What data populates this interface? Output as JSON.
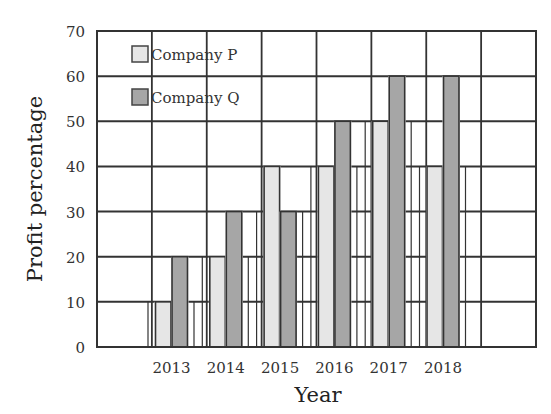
{
  "chart_data": {
    "type": "bar",
    "title": "",
    "xlabel": "Year",
    "ylabel": "Profit percentage",
    "categories": [
      "2013",
      "2014",
      "2015",
      "2016",
      "2017",
      "2018"
    ],
    "series": [
      {
        "name": "Company P",
        "values": [
          10,
          20,
          40,
          40,
          50,
          40
        ],
        "color": "#e6e6e6"
      },
      {
        "name": "Company Q",
        "values": [
          20,
          30,
          30,
          50,
          60,
          60
        ],
        "color": "#a6a6a6"
      }
    ],
    "ylim": [
      0,
      70
    ],
    "yticks": [
      0,
      10,
      20,
      30,
      40,
      50,
      60,
      70
    ],
    "grid": true,
    "legend_position": "top-left inside"
  },
  "legend": {
    "items": [
      {
        "label": "Company P"
      },
      {
        "label": "Company Q"
      }
    ]
  },
  "axes": {
    "x_title": "Year",
    "y_title": "Profit percentage"
  }
}
